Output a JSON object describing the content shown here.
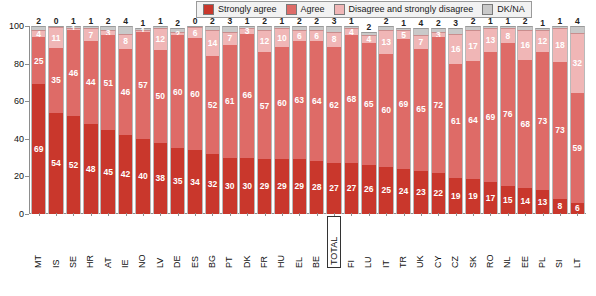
{
  "legend": {
    "items": [
      {
        "label": "Strongly agree",
        "color": "#c9372c",
        "icon": "square-swatch-icon"
      },
      {
        "label": "Agree",
        "color": "#de6b67",
        "icon": "square-swatch-icon"
      },
      {
        "label": "Disagree and strongly disagree",
        "color": "#f0b6b6",
        "icon": "square-swatch-icon"
      },
      {
        "label": "DK/NA",
        "color": "#c9c9c9",
        "icon": "square-swatch-icon"
      }
    ]
  },
  "axis": {
    "yticks": [
      "100",
      "80",
      "60",
      "40",
      "20",
      "0"
    ]
  },
  "chart_data": {
    "type": "bar",
    "title": "",
    "xlabel": "",
    "ylabel": "",
    "ylim": [
      0,
      100
    ],
    "grid": false,
    "stacked": true,
    "legend_position": "top-right",
    "categories": [
      "MT",
      "IS",
      "SE",
      "HR",
      "AT",
      "IE",
      "NO",
      "LV",
      "DE",
      "ES",
      "BG",
      "PT",
      "DK",
      "FR",
      "HU",
      "EL",
      "BE",
      "TOTAL",
      "FI",
      "LU",
      "IT",
      "TR",
      "UK",
      "CY",
      "CZ",
      "SK",
      "RO",
      "NL",
      "EE",
      "PL",
      "SI",
      "LT"
    ],
    "highlight_category": "TOTAL",
    "series": [
      {
        "name": "Strongly agree",
        "color": "#c9372c",
        "values": [
          69,
          54,
          52,
          48,
          45,
          42,
          40,
          38,
          35,
          34,
          32,
          30,
          30,
          29,
          29,
          29,
          28,
          27,
          27,
          26,
          25,
          24,
          23,
          22,
          19,
          19,
          17,
          15,
          14,
          13,
          8,
          6
        ]
      },
      {
        "name": "Agree",
        "color": "#de6b67",
        "values": [
          25,
          35,
          46,
          44,
          51,
          46,
          57,
          50,
          60,
          60,
          52,
          61,
          66,
          57,
          60,
          63,
          64,
          62,
          68,
          65,
          60,
          69,
          65,
          72,
          61,
          64,
          69,
          76,
          68,
          73,
          73,
          59
        ]
      },
      {
        "name": "Disagree and strongly disagree",
        "color": "#f0b6b6",
        "values": [
          4,
          11,
          1,
          7,
          3,
          8,
          1,
          12,
          2,
          6,
          14,
          7,
          3,
          12,
          10,
          6,
          6,
          8,
          4,
          4,
          13,
          5,
          7,
          3,
          16,
          17,
          13,
          8,
          16,
          12,
          18,
          32
        ]
      },
      {
        "name": "DK/NA",
        "color": "#c9c9c9",
        "values": [
          2,
          0,
          1,
          1,
          2,
          4,
          1,
          1,
          2,
          0,
          2,
          3,
          1,
          2,
          1,
          2,
          2,
          3,
          1,
          2,
          2,
          1,
          4,
          2,
          3,
          2,
          1,
          1,
          2,
          1,
          1,
          4
        ]
      }
    ]
  }
}
